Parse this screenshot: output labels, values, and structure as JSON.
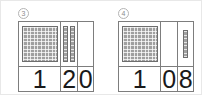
{
  "page": {
    "type": "place-value-worksheet",
    "background_color": "#ffffff",
    "block_color": "#a0a0a0",
    "block_outline_color": "#6e6e6e",
    "table_border_color": "#7d7d7d",
    "digit_color": "#1a1a1a"
  },
  "panels": [
    {
      "label": "3",
      "label_style": "circled-number",
      "columns": [
        {
          "place": "hundreds",
          "block_type": "flat",
          "block_count": 1,
          "grid_rows": 10,
          "grid_cols": 10,
          "digit": "1"
        },
        {
          "place": "tens",
          "block_type": "rod",
          "block_count": 2,
          "grid_rows": 10,
          "grid_cols": 1,
          "digit": "2"
        },
        {
          "place": "ones",
          "block_type": "unit",
          "block_count": 0,
          "grid_rows": 0,
          "grid_cols": 0,
          "digit": "0"
        }
      ],
      "number": "120"
    },
    {
      "label": "4",
      "label_style": "circled-number",
      "columns": [
        {
          "place": "hundreds",
          "block_type": "flat",
          "block_count": 1,
          "grid_rows": 10,
          "grid_cols": 10,
          "digit": "1"
        },
        {
          "place": "tens",
          "block_type": "rod",
          "block_count": 0,
          "grid_rows": 0,
          "grid_cols": 0,
          "digit": "0"
        },
        {
          "place": "ones",
          "block_type": "unit",
          "block_count": 8,
          "grid_rows": 8,
          "grid_cols": 1,
          "digit": "8"
        }
      ],
      "number": "108"
    }
  ]
}
